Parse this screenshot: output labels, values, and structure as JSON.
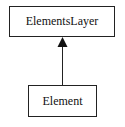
{
  "diagram": {
    "type": "uml-class-inheritance",
    "nodes": [
      {
        "id": "parent",
        "label": "ElementsLayer"
      },
      {
        "id": "child",
        "label": "Element"
      }
    ],
    "edges": [
      {
        "from": "child",
        "to": "parent",
        "arrow": "filled-triangle"
      }
    ],
    "colors": {
      "stroke": "#222222",
      "background": "#ffffff"
    }
  }
}
